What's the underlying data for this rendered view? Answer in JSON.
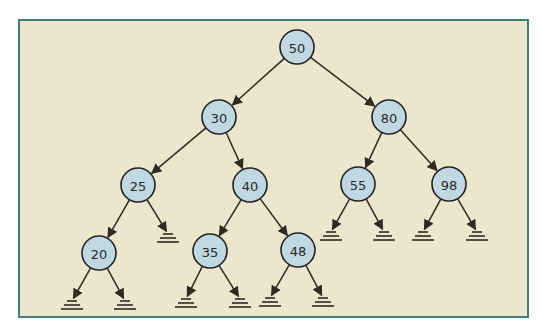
{
  "diagram": {
    "title": "",
    "type": "binary search tree",
    "colors": {
      "background": "#ebe6cc",
      "border": "#3f7e7a",
      "node_fill": "#bfd8e2",
      "node_stroke": "#222222",
      "edge": "#2e2a24"
    },
    "nodes": [
      {
        "id": "n50",
        "label": "50",
        "x": 297,
        "y": 47
      },
      {
        "id": "n30",
        "label": "30",
        "x": 219,
        "y": 117
      },
      {
        "id": "n80",
        "label": "80",
        "x": 389,
        "y": 117
      },
      {
        "id": "n25",
        "label": "25",
        "x": 138,
        "y": 185
      },
      {
        "id": "n40",
        "label": "40",
        "x": 250,
        "y": 185
      },
      {
        "id": "n55",
        "label": "55",
        "x": 358,
        "y": 184
      },
      {
        "id": "n98",
        "label": "98",
        "x": 449,
        "y": 184
      },
      {
        "id": "n20",
        "label": "20",
        "x": 99,
        "y": 253
      },
      {
        "id": "n35",
        "label": "35",
        "x": 210,
        "y": 251
      },
      {
        "id": "n48",
        "label": "48",
        "x": 298,
        "y": 250
      }
    ],
    "null_leaves": [
      {
        "id": "g25r",
        "x": 168,
        "y": 234
      },
      {
        "id": "g55l",
        "x": 331,
        "y": 232
      },
      {
        "id": "g55r",
        "x": 384,
        "y": 232
      },
      {
        "id": "g98l",
        "x": 423,
        "y": 232
      },
      {
        "id": "g98r",
        "x": 477,
        "y": 232
      },
      {
        "id": "g20l",
        "x": 72,
        "y": 301
      },
      {
        "id": "g20r",
        "x": 125,
        "y": 301
      },
      {
        "id": "g35l",
        "x": 186,
        "y": 299
      },
      {
        "id": "g35r",
        "x": 240,
        "y": 299
      },
      {
        "id": "g48l",
        "x": 270,
        "y": 298
      },
      {
        "id": "g48r",
        "x": 323,
        "y": 298
      }
    ],
    "edges": [
      [
        "n50",
        "n30"
      ],
      [
        "n50",
        "n80"
      ],
      [
        "n30",
        "n25"
      ],
      [
        "n30",
        "n40"
      ],
      [
        "n80",
        "n55"
      ],
      [
        "n80",
        "n98"
      ],
      [
        "n25",
        "n20"
      ],
      [
        "n25",
        "g25r"
      ],
      [
        "n40",
        "n35"
      ],
      [
        "n40",
        "n48"
      ],
      [
        "n55",
        "g55l"
      ],
      [
        "n55",
        "g55r"
      ],
      [
        "n98",
        "g98l"
      ],
      [
        "n98",
        "g98r"
      ],
      [
        "n20",
        "g20l"
      ],
      [
        "n20",
        "g20r"
      ],
      [
        "n35",
        "g35l"
      ],
      [
        "n35",
        "g35r"
      ],
      [
        "n48",
        "g48l"
      ],
      [
        "n48",
        "g48r"
      ]
    ]
  }
}
